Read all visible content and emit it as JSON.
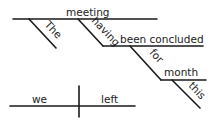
{
  "diagram": {
    "type": "sentence-diagram",
    "clause1": {
      "subject": "meeting",
      "modifier_subject": "The",
      "participle_aux": "having",
      "participle": "been concluded",
      "preposition": "for",
      "prep_object": "month",
      "prep_object_modifier": "this"
    },
    "clause2": {
      "subject": "we",
      "verb": "left"
    }
  }
}
